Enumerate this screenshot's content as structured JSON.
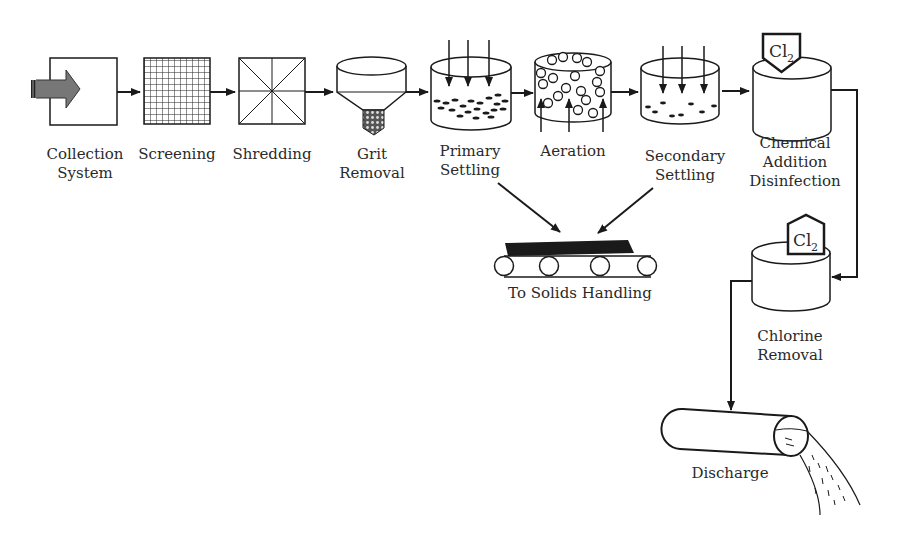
{
  "diagram": {
    "stages": [
      {
        "id": "collection",
        "label": "Collection\nSystem"
      },
      {
        "id": "screening",
        "label": "Screening"
      },
      {
        "id": "shredding",
        "label": "Shredding"
      },
      {
        "id": "grit",
        "label": "Grit\nRemoval"
      },
      {
        "id": "primary",
        "label": "Primary\nSettling"
      },
      {
        "id": "aeration",
        "label": "Aeration"
      },
      {
        "id": "secondary",
        "label": "Secondary\nSettling"
      },
      {
        "id": "chemical",
        "label": "Chemical\nAddition\nDisinfection"
      },
      {
        "id": "solids",
        "label": "To Solids Handling"
      },
      {
        "id": "chlorine_removal",
        "label": "Chlorine\nRemoval"
      },
      {
        "id": "discharge",
        "label": "Discharge"
      }
    ],
    "chemical_tags": {
      "disinfection": "Cl2",
      "removal": "Cl2"
    },
    "colors": {
      "line": "#1a1a1a",
      "arrow_fill": "#777777"
    }
  }
}
